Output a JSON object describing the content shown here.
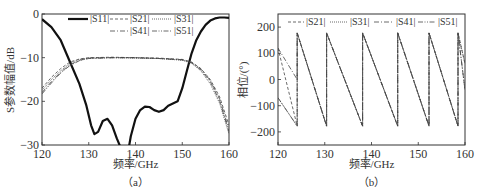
{
  "chart_data": [
    {
      "panel": "a",
      "type": "line",
      "caption": "（a）",
      "xlabel": "频率/GHz",
      "ylabel": "S参数幅值/dB",
      "xlim": [
        120,
        160
      ],
      "ylim": [
        -30,
        0
      ],
      "xticks": [
        120,
        130,
        140,
        150,
        160
      ],
      "yticks": [
        0,
        -10,
        -20,
        -30
      ],
      "grid": false,
      "legend_position": "top, inside",
      "series": [
        {
          "name": "|S11|",
          "style": "solid-thick",
          "x": [
            120,
            122,
            124,
            126,
            128,
            129.5,
            130.5,
            131.2,
            132,
            133,
            134,
            135,
            136,
            136.8,
            137.2,
            138.5,
            139,
            140,
            141,
            142,
            143,
            144,
            145,
            146,
            147,
            148,
            149,
            150,
            151,
            152,
            153,
            154,
            155,
            156,
            157,
            158,
            159,
            160
          ],
          "y": [
            -1.2,
            -3,
            -6,
            -11,
            -16,
            -21,
            -25.5,
            -27.5,
            -27,
            -24.5,
            -24,
            -25.5,
            -28.5,
            -30.5,
            -31,
            -31,
            -28,
            -24,
            -22,
            -21.2,
            -21.3,
            -22,
            -22.4,
            -22,
            -21,
            -20.5,
            -20,
            -17,
            -13,
            -9,
            -6,
            -4,
            -2.5,
            -1.5,
            -1,
            -0.8,
            -0.8,
            -0.9
          ]
        },
        {
          "name": "|S21|",
          "style": "dashed",
          "x": [
            120,
            122,
            124,
            126,
            128,
            130,
            135,
            140,
            145,
            150,
            152,
            154,
            156,
            158,
            160
          ],
          "y": [
            -17,
            -14.5,
            -12.5,
            -11,
            -10.3,
            -10,
            -9.9,
            -10,
            -10.1,
            -10.4,
            -11,
            -12.5,
            -15,
            -19,
            -25.5
          ]
        },
        {
          "name": "|S31|",
          "style": "dotted",
          "x": [
            120,
            122,
            124,
            126,
            128,
            130,
            135,
            140,
            145,
            150,
            152,
            154,
            156,
            158,
            160
          ],
          "y": [
            -17.5,
            -15,
            -13,
            -11.3,
            -10.4,
            -10.1,
            -10,
            -10.1,
            -10.2,
            -10.6,
            -11.3,
            -13,
            -16,
            -20.5,
            -27.5
          ]
        },
        {
          "name": "|S41|",
          "style": "dash-dot",
          "x": [
            120,
            122,
            124,
            126,
            128,
            130,
            135,
            140,
            145,
            150,
            152,
            154,
            156,
            158,
            160
          ],
          "y": [
            -18,
            -15.5,
            -13.3,
            -11.6,
            -10.6,
            -10.1,
            -10,
            -10,
            -10.2,
            -10.5,
            -11.2,
            -12.8,
            -15.5,
            -20,
            -27
          ]
        },
        {
          "name": "|S51|",
          "style": "dash-dot-dot",
          "x": [
            120,
            122,
            124,
            126,
            128,
            130,
            135,
            140,
            145,
            150,
            152,
            154,
            156,
            158,
            160
          ],
          "y": [
            -18.3,
            -15.8,
            -13.5,
            -11.8,
            -10.7,
            -10.2,
            -10,
            -10,
            -10.2,
            -10.5,
            -11.1,
            -12.6,
            -15.2,
            -19.5,
            -26.5
          ]
        }
      ]
    },
    {
      "panel": "b",
      "type": "line",
      "caption": "（b）",
      "xlabel": "频率/GHz",
      "ylabel": "相位/(°)",
      "xlim": [
        120,
        160
      ],
      "ylim": [
        -250,
        250
      ],
      "xticks": [
        120,
        130,
        140,
        150,
        160
      ],
      "yticks": [
        200,
        100,
        0,
        -100,
        -200
      ],
      "grid": false,
      "legend_position": "top, inside",
      "phase_wrap_frequencies_GHz": [
        124.1,
        130.4,
        138.1,
        145.6,
        152.3,
        158.5
      ],
      "series": [
        {
          "name": "|S21|",
          "style": "dashed",
          "x": [
            120,
            124.1,
            124.1,
            130.4,
            130.4,
            138.1,
            138.1,
            145.6,
            145.6,
            152.3,
            152.3,
            158.5,
            158.5,
            160
          ],
          "y": [
            120,
            -178,
            178,
            -178,
            178,
            -178,
            178,
            -178,
            178,
            -178,
            178,
            -178,
            178,
            60
          ]
        },
        {
          "name": "|S31|",
          "style": "dotted",
          "x": [
            120,
            124.1,
            124.1,
            130.4,
            130.4,
            138.1,
            138.1,
            145.6,
            145.6,
            152.3,
            152.3,
            158.5,
            158.5,
            160
          ],
          "y": [
            -70,
            -178,
            178,
            -178,
            178,
            -178,
            178,
            -178,
            178,
            -178,
            178,
            -178,
            178,
            60
          ]
        },
        {
          "name": "|S41|",
          "style": "dash-dot",
          "x": [
            120,
            124.1,
            124.1,
            130.4,
            130.4,
            138.1,
            138.1,
            145.6,
            145.6,
            152.3,
            152.3,
            158.5,
            158.5,
            160
          ],
          "y": [
            120,
            0,
            178,
            -178,
            178,
            -178,
            178,
            -178,
            178,
            -178,
            178,
            -178,
            178,
            -40
          ]
        },
        {
          "name": "|S51|",
          "style": "dash-dot-dot",
          "x": [
            120,
            124.1,
            124.1,
            130.4,
            130.4,
            138.1,
            138.1,
            145.6,
            145.6,
            152.3,
            152.3,
            158.5,
            158.5,
            160
          ],
          "y": [
            -70,
            -178,
            178,
            -178,
            178,
            -178,
            178,
            -178,
            178,
            -178,
            178,
            -178,
            178,
            -40
          ]
        }
      ]
    }
  ],
  "labels": {
    "a": {
      "xlabel": "频率/GHz",
      "ylabel": "S参数幅值/dB",
      "caption": "（a）",
      "xticks": [
        "120",
        "130",
        "140",
        "150",
        "160"
      ],
      "yticks": [
        "0",
        "−10",
        "−20",
        "−30"
      ],
      "legend": [
        "|S11|",
        "|S21|",
        "|S31|",
        "|S41|",
        "|S51|"
      ]
    },
    "b": {
      "xlabel": "频率/GHz",
      "ylabel": "相位/(°)",
      "caption": "（b）",
      "xticks": [
        "120",
        "130",
        "140",
        "150",
        "160"
      ],
      "yticks": [
        "200",
        "100",
        "0",
        "−100",
        "−200"
      ],
      "legend": [
        "|S21|",
        "|S31|",
        "|S41|",
        "|S51|"
      ]
    }
  }
}
